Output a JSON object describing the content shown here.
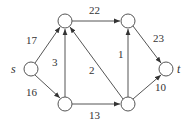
{
  "graph": {
    "type": "flow-network",
    "nodes": [
      {
        "id": "s",
        "label": "s",
        "x": 31,
        "y": 69
      },
      {
        "id": "v1",
        "label": "",
        "x": 65,
        "y": 21
      },
      {
        "id": "v2",
        "label": "",
        "x": 128,
        "y": 21
      },
      {
        "id": "v3",
        "label": "",
        "x": 65,
        "y": 104
      },
      {
        "id": "v4",
        "label": "",
        "x": 128,
        "y": 104
      },
      {
        "id": "t",
        "label": "t",
        "x": 166,
        "y": 69
      }
    ],
    "edges": [
      {
        "from": "s",
        "to": "v1",
        "capacity": "17"
      },
      {
        "from": "s",
        "to": "v3",
        "capacity": "16"
      },
      {
        "from": "v3",
        "to": "v1",
        "capacity": "3"
      },
      {
        "from": "v4",
        "to": "v1",
        "capacity": "2"
      },
      {
        "from": "v1",
        "to": "v2",
        "capacity": "22"
      },
      {
        "from": "v4",
        "to": "v2",
        "capacity": "1"
      },
      {
        "from": "v3",
        "to": "v4",
        "capacity": "13"
      },
      {
        "from": "v2",
        "to": "t",
        "capacity": "23"
      },
      {
        "from": "v4",
        "to": "t",
        "capacity": "10"
      }
    ]
  },
  "labels": {
    "source": "s",
    "sink": "t",
    "e_s_v1": "17",
    "e_s_v3": "16",
    "e_v3_v1": "3",
    "e_v4_v1": "2",
    "e_v1_v2": "22",
    "e_v4_v2": "1",
    "e_v3_v4": "13",
    "e_v2_t": "23",
    "e_v4_t": "10"
  }
}
